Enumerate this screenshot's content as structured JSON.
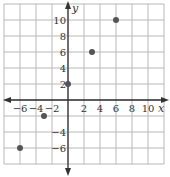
{
  "chart_data": {
    "type": "scatter",
    "title": "",
    "xlabel": "x",
    "ylabel": "y",
    "xlim": [
      -8,
      12
    ],
    "ylim": [
      -8,
      12
    ],
    "grid": true,
    "grid_step": 2,
    "x_ticks": [
      -6,
      -4,
      -2,
      2,
      4,
      6,
      8,
      10
    ],
    "y_ticks": [
      -6,
      -4,
      2,
      4,
      6,
      8,
      10
    ],
    "x_tick_labels": [
      "−6",
      "−4",
      "−2",
      "2",
      "4",
      "6",
      "8",
      "10"
    ],
    "y_tick_labels": [
      "−6",
      "−4",
      "2",
      "4",
      "6",
      "8",
      "10"
    ],
    "series": [
      {
        "name": "points",
        "x": [
          -6,
          -3,
          0,
          3,
          6
        ],
        "y": [
          -6,
          -2,
          2,
          6,
          10
        ]
      }
    ],
    "colors": {
      "grid": "#b8b8b8",
      "axis": "#333333",
      "point": "#555555"
    }
  }
}
